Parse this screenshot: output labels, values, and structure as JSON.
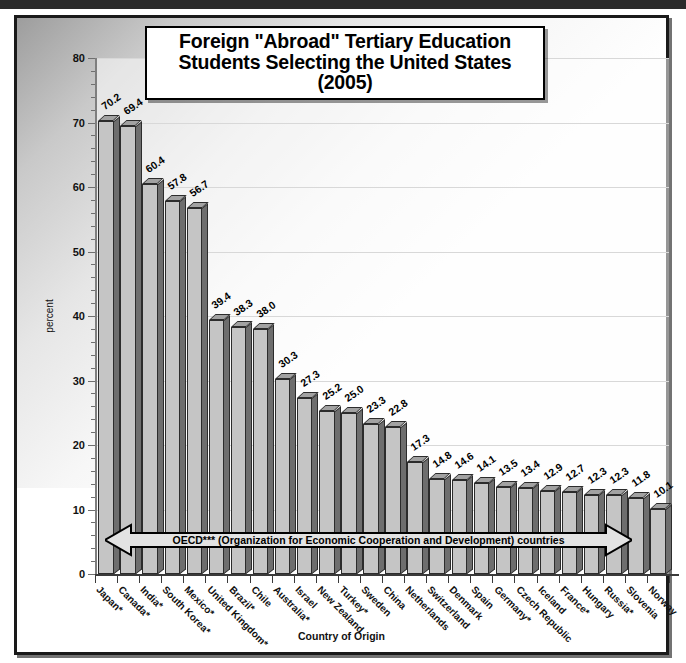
{
  "page": {
    "x_axis_title": "Country of Origin",
    "y_axis_title": "percent",
    "annotation": "OECD*** (Organization for Economic Cooperation and Development) countries"
  },
  "title": {
    "line1": "Foreign \"Abroad\" Tertiary Education",
    "line2": "Students Selecting the United States",
    "line3": "(2005)"
  },
  "colors": {
    "bar_front": "#c5c5c5",
    "bar_side": "#6e6e6e",
    "bar_top": "#a2a2a2",
    "bar_outline": "#2c2c2c",
    "frame": "#1a1a1a",
    "gridline": "#d8d8d8",
    "axis": "#3a3a3a"
  },
  "chart_data": {
    "type": "bar",
    "title": "Foreign \"Abroad\" Tertiary Education Students Selecting the United States (2005)",
    "xlabel": "Country of Origin",
    "ylabel": "percent",
    "ylim": [
      0,
      80
    ],
    "ytick_step": 10,
    "yticks": [
      0,
      10,
      20,
      30,
      40,
      50,
      60,
      70,
      80
    ],
    "minor_ticks": true,
    "grid": true,
    "legend": "none",
    "annotation": "OECD*** (Organization for Economic Cooperation and Development) countries",
    "categories": [
      "Japan*",
      "Canada*",
      "India*",
      "South Korea*",
      "Mexico*",
      "United Kingdom*",
      "Brazil*",
      "Chile",
      "Australia*",
      "Israel",
      "New Zealand",
      "Turkey*",
      "Sweden",
      "China",
      "Netherlands",
      "Switzerland",
      "Denmark",
      "Spain",
      "Germany*",
      "Czech Republic",
      "Iceland",
      "France*",
      "Hungary",
      "Russia*",
      "Slovenia",
      "Norway"
    ],
    "values": [
      70.2,
      69.4,
      60.4,
      57.8,
      56.7,
      39.4,
      38.3,
      38.0,
      30.3,
      27.3,
      25.2,
      25.0,
      23.3,
      22.8,
      17.3,
      14.8,
      14.6,
      14.1,
      13.5,
      13.4,
      12.9,
      12.7,
      12.3,
      12.3,
      11.8,
      10.1
    ]
  }
}
